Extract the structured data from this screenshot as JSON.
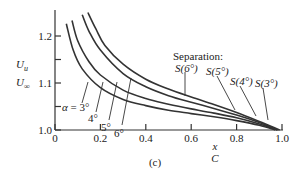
{
  "chart_data": {
    "type": "line",
    "title": "",
    "panel_label": "(c)",
    "xlabel": {
      "numerator": "x",
      "denominator": "C"
    },
    "ylabel": {
      "numerator": "U_u",
      "denominator": "U_∞",
      "num_main": "U",
      "num_sub": "u",
      "den_main": "U",
      "den_sub": "∞"
    },
    "xlim": [
      0,
      1.0
    ],
    "ylim": [
      1.0,
      1.25
    ],
    "xticks": [
      0,
      0.2,
      0.4,
      0.6,
      0.8,
      1.0
    ],
    "xtick_labels": [
      "0",
      "0.2",
      "0.4",
      "0.6",
      "0.8",
      "1.0"
    ],
    "yticks": [
      1.0,
      1.05,
      1.1,
      1.15,
      1.2
    ],
    "ytick_labels": [
      "1.0",
      "",
      "1.1",
      "",
      "1.2"
    ],
    "grid": false,
    "legend": "none (curves labeled inline)",
    "annotation_header": "Separation:",
    "series": [
      {
        "name": "α = 3°",
        "label": "α = 3°",
        "separation_label": "S(3°)",
        "x": [
          0.05,
          0.08,
          0.12,
          0.2,
          0.3,
          0.4,
          0.5,
          0.6,
          0.7,
          0.8,
          0.9,
          0.97
        ],
        "y": [
          1.226,
          1.17,
          1.13,
          1.09,
          1.065,
          1.052,
          1.042,
          1.035,
          1.028,
          1.02,
          1.01,
          1.0
        ]
      },
      {
        "name": "α = 4°",
        "label": "4°",
        "separation_label": "S(4°)",
        "x": [
          0.075,
          0.1,
          0.15,
          0.2,
          0.3,
          0.4,
          0.5,
          0.6,
          0.7,
          0.8,
          0.9,
          0.98
        ],
        "y": [
          1.233,
          1.19,
          1.145,
          1.117,
          1.085,
          1.067,
          1.055,
          1.045,
          1.036,
          1.026,
          1.013,
          1.0
        ]
      },
      {
        "name": "α = 5°",
        "label": "5°",
        "separation_label": "S(5°)",
        "x": [
          0.12,
          0.15,
          0.2,
          0.3,
          0.4,
          0.5,
          0.6,
          0.7,
          0.8,
          0.9,
          0.98
        ],
        "y": [
          1.245,
          1.21,
          1.17,
          1.12,
          1.092,
          1.073,
          1.059,
          1.046,
          1.032,
          1.016,
          1.0
        ]
      },
      {
        "name": "α = 6°",
        "label": "6°",
        "separation_label": "S(6°)",
        "x": [
          0.145,
          0.18,
          0.22,
          0.3,
          0.4,
          0.5,
          0.6,
          0.7,
          0.8,
          0.9,
          0.99
        ],
        "y": [
          1.25,
          1.215,
          1.18,
          1.14,
          1.108,
          1.087,
          1.07,
          1.054,
          1.037,
          1.018,
          1.0
        ]
      }
    ]
  }
}
